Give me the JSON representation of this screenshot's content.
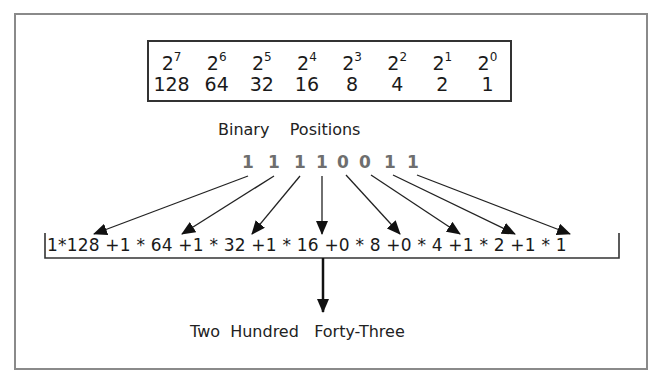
{
  "powers_table": {
    "exponents": [
      "7",
      "6",
      "5",
      "4",
      "3",
      "2",
      "1",
      "0"
    ],
    "base": "2",
    "values": [
      "128",
      "64",
      "32",
      "16",
      "8",
      "4",
      "2",
      "1"
    ]
  },
  "binary_positions_label": "Binary    Positions",
  "binary_digits": [
    "1",
    "1",
    "1",
    "1",
    "0",
    "0",
    "1",
    "1"
  ],
  "expression": "1*128 +1 * 64 +1 * 32 +1 * 16 +0 * 8 +0 * 4 +1 * 2 +1 * 1",
  "result_label": "Two  Hundred   Forty-Three",
  "colors": {
    "frame": "#8a8a8a",
    "text": "#1a1a1a",
    "binary_digits": "#6e6e6e"
  }
}
